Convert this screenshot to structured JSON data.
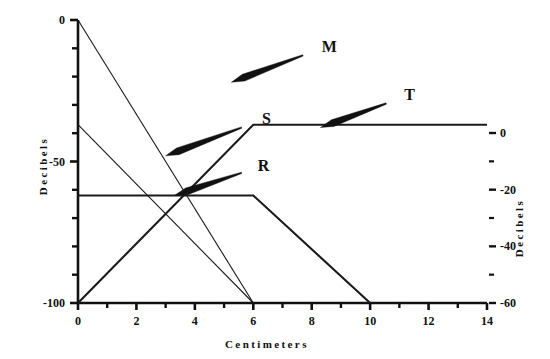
{
  "chart_data": {
    "type": "line",
    "title": "",
    "xlabel": "Centimeters",
    "ylabel": "Decibels",
    "ylabel_right": "Decibels",
    "xlim": [
      0,
      14
    ],
    "ylim": [
      -100,
      0
    ],
    "ylim_right": [
      -60,
      0
    ],
    "grid": false,
    "legend": "inline-arrow-annotations",
    "x_ticks_major": [
      0,
      2,
      4,
      6,
      8,
      10,
      12,
      14
    ],
    "x_tick_labels": [
      "0",
      "2",
      "4",
      "6",
      "8",
      "10",
      "12",
      "14"
    ],
    "x_ticks_minor": [
      1,
      3,
      5,
      7,
      9,
      11,
      13
    ],
    "y_ticks_major_left": [
      0,
      -50,
      -100
    ],
    "y_tick_labels_left": [
      "0",
      "-50",
      "-100"
    ],
    "y_ticks_minor_left": [
      -10,
      -20,
      -30,
      -40,
      -60,
      -70,
      -80,
      -90
    ],
    "y_ticks_major_right": [
      0,
      -20,
      -40,
      -60
    ],
    "y_tick_labels_right": [
      "0",
      "-20",
      "-40",
      "-60"
    ],
    "y_ticks_minor_right": [
      -10,
      -30,
      -50
    ],
    "series": [
      {
        "name": "M",
        "label": "M",
        "stroke_width": 1.1,
        "color": "#1a1a1a",
        "points": [
          [
            0,
            0
          ],
          [
            6,
            -100
          ]
        ],
        "annotation": {
          "label_x": 8.6,
          "label_y": -9.5,
          "arrow_tail_x": 7.7,
          "arrow_tail_y": -12.5,
          "arrow_tip_x": 5.25,
          "arrow_tip_y": -22.0
        }
      },
      {
        "name": "S",
        "label": "S",
        "stroke_width": 1.1,
        "color": "#1a1a1a",
        "points": [
          [
            0,
            -37
          ],
          [
            6,
            -100
          ]
        ],
        "annotation": {
          "label_x": 6.45,
          "label_y": -35.0,
          "arrow_tail_x": 5.6,
          "arrow_tail_y": -38.0,
          "arrow_tip_x": 3.0,
          "arrow_tip_y": -48.0
        }
      },
      {
        "name": "R",
        "label": "R",
        "stroke_width": 2.1,
        "color": "#1a1a1a",
        "points": [
          [
            0,
            -62
          ],
          [
            6,
            -62
          ],
          [
            10,
            -100
          ]
        ],
        "annotation": {
          "label_x": 6.35,
          "label_y": -51.5,
          "arrow_tail_x": 5.6,
          "arrow_tail_y": -54.0,
          "arrow_tip_x": 3.3,
          "arrow_tip_y": -62.0
        }
      },
      {
        "name": "T",
        "label": "T",
        "stroke_width": 2.1,
        "color": "#1a1a1a",
        "points": [
          [
            0,
            -100
          ],
          [
            6,
            -37
          ],
          [
            14,
            -37
          ]
        ],
        "annotation": {
          "label_x": 11.35,
          "label_y": -26.5,
          "arrow_tail_x": 10.55,
          "arrow_tail_y": -29.5,
          "arrow_tip_x": 8.3,
          "arrow_tip_y": -38.0
        }
      }
    ]
  }
}
